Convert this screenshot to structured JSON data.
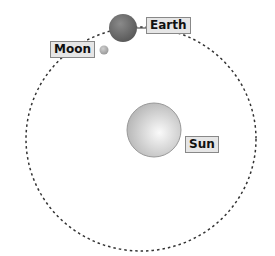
{
  "diagram": {
    "labels": {
      "earth": "Earth",
      "moon": "Moon",
      "sun": "Sun"
    },
    "colors": {
      "orbit": "#333333",
      "label_bg": "#e6e6e6",
      "label_border": "#888888"
    }
  }
}
